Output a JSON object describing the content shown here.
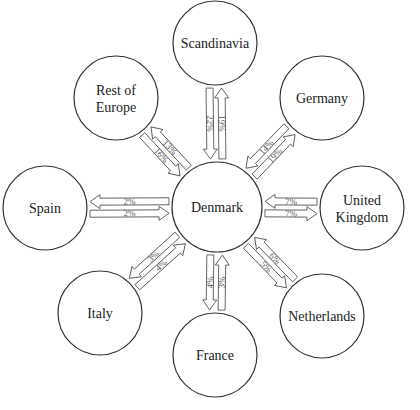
{
  "diagram": {
    "type": "hub-and-spoke flow diagram",
    "center": {
      "id": "denmark",
      "label": "Denmark",
      "x": 217,
      "y": 207,
      "r": 45
    },
    "nodes": [
      {
        "id": "scandinavia",
        "lines": [
          "Scandinavia"
        ],
        "x": 215,
        "y": 43,
        "r": 42,
        "in_to_denmark": "22%",
        "out_from_denmark": "19%"
      },
      {
        "id": "germany",
        "lines": [
          "Germany"
        ],
        "x": 322,
        "y": 98,
        "r": 42,
        "in_to_denmark": "14%",
        "out_from_denmark": "19%"
      },
      {
        "id": "united-kingdom",
        "lines": [
          "United",
          "Kingdom"
        ],
        "x": 362,
        "y": 208,
        "r": 42,
        "in_to_denmark": "7%",
        "out_from_denmark": "7%"
      },
      {
        "id": "netherlands",
        "lines": [
          "Netherlands"
        ],
        "x": 322,
        "y": 316,
        "r": 42,
        "in_to_denmark": "6%",
        "out_from_denmark": "5%"
      },
      {
        "id": "france",
        "lines": [
          "France"
        ],
        "x": 215,
        "y": 355,
        "r": 42,
        "in_to_denmark": "3%",
        "out_from_denmark": "4%"
      },
      {
        "id": "italy",
        "lines": [
          "Italy"
        ],
        "x": 100,
        "y": 313,
        "r": 42,
        "in_to_denmark": "4%",
        "out_from_denmark": "3%"
      },
      {
        "id": "spain",
        "lines": [
          "Spain"
        ],
        "x": 45,
        "y": 208,
        "r": 42,
        "in_to_denmark": "2%",
        "out_from_denmark": "2%"
      },
      {
        "id": "rest-of-europe",
        "lines": [
          "Rest of",
          "Europe"
        ],
        "x": 116,
        "y": 98,
        "r": 42,
        "in_to_denmark": "16%",
        "out_from_denmark": "13%"
      }
    ],
    "colors": {
      "stroke": "#333333",
      "arrow_stroke": "#555555",
      "background": "#ffffff"
    }
  }
}
